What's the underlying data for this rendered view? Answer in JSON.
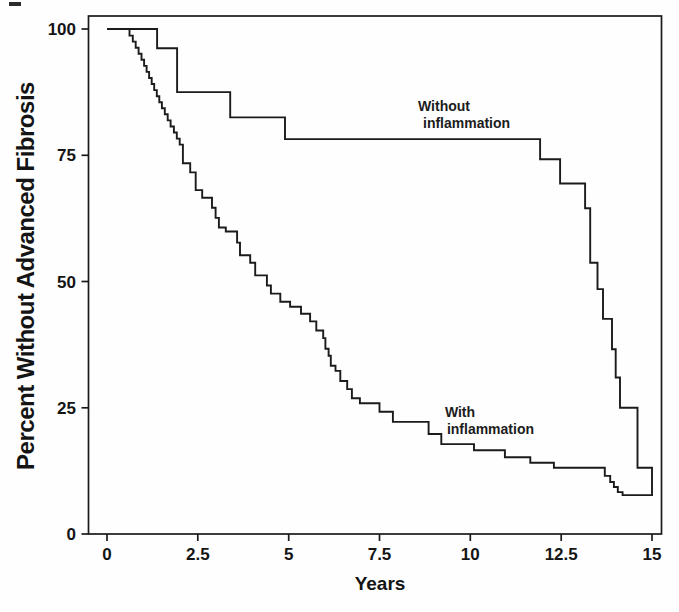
{
  "figure": {
    "background_color": "#fefefe",
    "line_color": "#1b1b1b"
  },
  "chart_data": {
    "type": "line",
    "subtype": "kaplan-meier-step-survival",
    "title": "",
    "xlabel": "Years",
    "ylabel": "Percent Without Advanced Fibrosis",
    "xlim": [
      0,
      15
    ],
    "ylim": [
      0,
      100
    ],
    "xticks": [
      0,
      2.5,
      5,
      7.5,
      10,
      12.5,
      15
    ],
    "xtick_labels": [
      "0",
      "2.5",
      "5",
      "7.5",
      "10",
      "12.5",
      "15"
    ],
    "yticks": [
      0,
      25,
      50,
      75,
      100
    ],
    "ytick_labels": [
      "0",
      "25",
      "50",
      "75",
      "100"
    ],
    "grid": false,
    "legend_position": "inline-annotations",
    "series": [
      {
        "name": "Without inflammation",
        "end_t": 15,
        "points": [
          [
            0,
            100
          ],
          [
            1.38,
            96.2
          ],
          [
            1.93,
            87.5
          ],
          [
            3.39,
            82.5
          ],
          [
            4.9,
            78.2
          ],
          [
            11.92,
            74.2
          ],
          [
            12.47,
            69.4
          ],
          [
            13.16,
            64.5
          ],
          [
            13.3,
            53.7
          ],
          [
            13.5,
            48.5
          ],
          [
            13.65,
            42.6
          ],
          [
            13.9,
            36.6
          ],
          [
            14.0,
            31.0
          ],
          [
            14.12,
            25.0
          ],
          [
            14.6,
            13.1
          ],
          [
            15,
            7.5
          ]
        ]
      },
      {
        "name": "With inflammation",
        "end_t": 15,
        "points": [
          [
            0,
            100
          ],
          [
            0.62,
            98.7
          ],
          [
            0.71,
            97.5
          ],
          [
            0.79,
            96.3
          ],
          [
            0.87,
            95.1
          ],
          [
            0.95,
            93.9
          ],
          [
            1.02,
            92.7
          ],
          [
            1.09,
            91.5
          ],
          [
            1.16,
            90.3
          ],
          [
            1.23,
            89.1
          ],
          [
            1.3,
            87.9
          ],
          [
            1.37,
            86.7
          ],
          [
            1.44,
            85.5
          ],
          [
            1.51,
            84.3
          ],
          [
            1.59,
            83.1
          ],
          [
            1.67,
            81.9
          ],
          [
            1.75,
            80.7
          ],
          [
            1.84,
            79.5
          ],
          [
            1.92,
            78.3
          ],
          [
            2.0,
            77.1
          ],
          [
            2.09,
            73.4
          ],
          [
            2.29,
            71.6
          ],
          [
            2.44,
            68.1
          ],
          [
            2.62,
            66.6
          ],
          [
            2.89,
            64.6
          ],
          [
            2.99,
            62.6
          ],
          [
            3.08,
            60.7
          ],
          [
            3.27,
            59.9
          ],
          [
            3.58,
            57.7
          ],
          [
            3.66,
            55.2
          ],
          [
            3.94,
            53.7
          ],
          [
            4.08,
            51.2
          ],
          [
            4.4,
            49.2
          ],
          [
            4.51,
            47.6
          ],
          [
            4.77,
            46.0
          ],
          [
            5.04,
            45.0
          ],
          [
            5.34,
            43.6
          ],
          [
            5.59,
            42.1
          ],
          [
            5.76,
            40.3
          ],
          [
            5.95,
            38.8
          ],
          [
            6.01,
            36.7
          ],
          [
            6.1,
            35.3
          ],
          [
            6.16,
            33.3
          ],
          [
            6.29,
            32.3
          ],
          [
            6.42,
            30.3
          ],
          [
            6.61,
            28.7
          ],
          [
            6.74,
            26.9
          ],
          [
            6.96,
            25.9
          ],
          [
            7.5,
            24.2
          ],
          [
            7.87,
            22.2
          ],
          [
            8.85,
            19.8
          ],
          [
            9.2,
            17.8
          ],
          [
            10.1,
            16.6
          ],
          [
            10.95,
            15.2
          ],
          [
            11.65,
            14.1
          ],
          [
            12.3,
            13.1
          ],
          [
            13.7,
            11.5
          ],
          [
            13.85,
            10.3
          ],
          [
            13.95,
            9.3
          ],
          [
            14.06,
            8.3
          ],
          [
            14.19,
            7.7
          ]
        ]
      }
    ],
    "annotations": [
      {
        "lines": [
          "Without",
          "inflammation"
        ],
        "t": 8.56,
        "pct": 83.8,
        "indent2": 5
      },
      {
        "lines": [
          "With",
          "inflammation"
        ],
        "t": 9.3,
        "pct": 23.2,
        "indent2": 2
      }
    ]
  }
}
